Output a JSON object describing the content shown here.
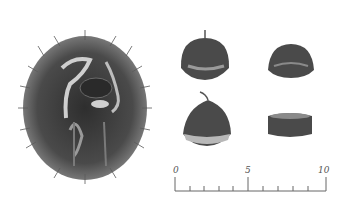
{
  "figure": {
    "burr": {
      "label": "spiny husk (burr), opened"
    },
    "nuts": [
      {
        "position": "top-left",
        "view": "side view with tip"
      },
      {
        "position": "top-right",
        "view": "side view"
      },
      {
        "position": "bottom-left",
        "view": "front view with tip"
      },
      {
        "position": "bottom-right",
        "view": "top/end view"
      }
    ],
    "scale": {
      "labels": [
        "0",
        "5",
        "10"
      ],
      "unit_mark": "10"
    }
  },
  "colors": {
    "background": "#ffffff",
    "burr_dark": "#3e3e3e",
    "spine": "#555555",
    "nut_dark": "#4a4a4a",
    "nut_light": "#b8b8b8",
    "scale_line": "#666666"
  }
}
